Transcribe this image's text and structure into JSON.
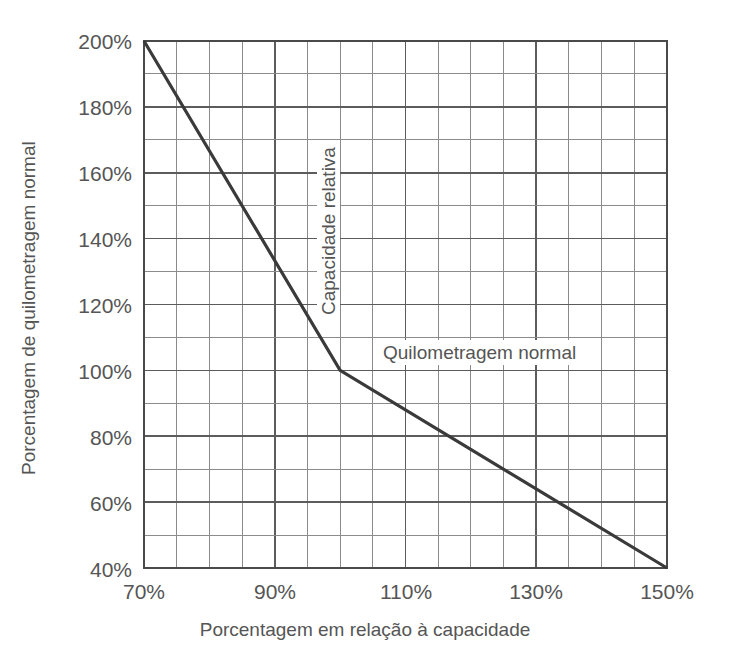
{
  "chart_data": {
    "type": "line",
    "title": "",
    "xlabel": "Porcentagem em relação à capacidade",
    "ylabel": "Porcentagem de quilometragem normal",
    "xlim": [
      70,
      150
    ],
    "ylim": [
      40,
      200
    ],
    "x_major_ticks": [
      70,
      90,
      110,
      130,
      150
    ],
    "x_major_tick_labels": [
      "70%",
      "90%",
      "110%",
      "130%",
      "150%"
    ],
    "x_minor_step": 5,
    "y_major_ticks": [
      40,
      60,
      80,
      100,
      120,
      140,
      160,
      180,
      200
    ],
    "y_major_tick_labels": [
      "40%",
      "60%",
      "80%",
      "100%",
      "120%",
      "140%",
      "160%",
      "180%",
      "200%"
    ],
    "y_minor_step": 10,
    "grid": true,
    "legend": "none",
    "series": [
      {
        "name": "Quilometragem normal",
        "color": "#3a3a3a",
        "x": [
          70,
          100,
          150
        ],
        "y": [
          200,
          100,
          40
        ]
      }
    ],
    "annotations": [
      {
        "name": "capacidade-relativa",
        "text": "Capacidade relativa",
        "x": 100,
        "y_range": [
          120,
          180
        ],
        "rotation": -90
      },
      {
        "name": "quilometragem-normal",
        "text": "Quilometragem normal",
        "x_range": [
          107,
          120
        ],
        "y": 105,
        "rotation": 0
      }
    ]
  },
  "axes": {
    "x_title": "Porcentagem em relação à capacidade",
    "y_title": "Porcentagem de quilometragem normal"
  },
  "colors": {
    "line": "#3a3a3a",
    "grid_minor": "#8b8b8b",
    "grid_major": "#5c5c5c",
    "frame": "#4a4a4a",
    "text": "#555555",
    "background": "#ffffff"
  }
}
